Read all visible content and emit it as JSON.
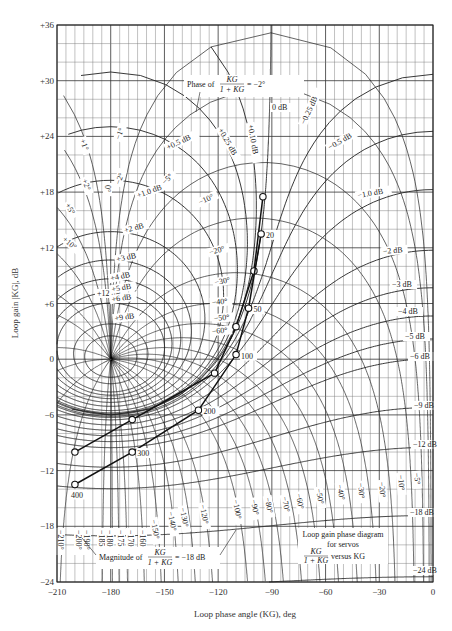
{
  "chart_data": {
    "type": "line",
    "xlabel": "Loop phase angle (KG), deg",
    "ylabel": "Loop gain |KG|, dB",
    "xlim": [
      -210,
      0
    ],
    "ylim": [
      -24,
      36
    ],
    "grid": true,
    "x_ticks": [
      "-210",
      "-180",
      "-150",
      "-120",
      "-90",
      "-60",
      "-30",
      "0"
    ],
    "y_ticks": [
      "+36",
      "+30",
      "+24",
      "+18",
      "+12",
      "+6",
      "0",
      "-6",
      "-12",
      "-18",
      "-24"
    ],
    "magnitude_contours_db": [
      "+12 dB",
      "+9 dB",
      "+6 dB",
      "+5 dB",
      "+4 dB",
      "+3 dB",
      "+2 dB",
      "+1.0 dB",
      "+0.5 dB",
      "+0.25 dB",
      "+0.10 dB",
      "0 dB",
      "-0.25 dB",
      "-0.5 dB",
      "-1.0 dB",
      "-2 dB",
      "-3 dB",
      "-4 dB",
      "-5 dB",
      "-6 dB",
      "-9 dB",
      "-12 dB",
      "-18 dB",
      "-24 dB"
    ],
    "phase_contours_deg": [
      "+1°",
      "+2°",
      "+5°",
      "+10°",
      "0°",
      "-1°",
      "-2°",
      "-5°",
      "-10°",
      "-20°",
      "-30°",
      "-40°",
      "-50°",
      "-60°",
      "-5°",
      "-10°",
      "-20°",
      "-30°",
      "-40°",
      "-50°",
      "-60°",
      "-70°",
      "-80°",
      "-90°",
      "-100°",
      "-120°",
      "-130°",
      "-140°",
      "-150°",
      "-160°",
      "-170°",
      "-175°",
      "-180°",
      "-185°",
      "-190°",
      "-200°",
      "-210°"
    ],
    "series": [
      {
        "name": "Locus A",
        "points": [
          {
            "x": -95,
            "y": 17.5,
            "label": ""
          },
          {
            "x": -100,
            "y": 9.5,
            "label": ""
          },
          {
            "x": -110,
            "y": 3.5,
            "label": ""
          },
          {
            "x": -122,
            "y": -1.5,
            "label": ""
          },
          {
            "x": -168,
            "y": -6.5,
            "label": ""
          },
          {
            "x": -200,
            "y": -10.0,
            "label": ""
          }
        ]
      },
      {
        "name": "Locus B",
        "points": [
          {
            "x": -96,
            "y": 13.5,
            "label": "20"
          },
          {
            "x": -103,
            "y": 5.5,
            "label": "50"
          },
          {
            "x": -110,
            "y": 0.5,
            "label": "100"
          },
          {
            "x": -131,
            "y": -5.5,
            "label": "200"
          },
          {
            "x": -168,
            "y": -10.0,
            "label": "300"
          },
          {
            "x": -200,
            "y": -13.5,
            "label": "400"
          }
        ]
      }
    ],
    "annotations": [
      "Phase of KG/(1+KG) = -2°",
      "Magnitude of KG/(1+KG) = -18 dB",
      "Loop gain phase diagram for servos",
      "KG/(1+KG) versus KG"
    ]
  },
  "labels": {
    "xlabel": "Loop phase angle (KG), deg",
    "ylabel": "Loop gain |KG|, dB",
    "phase_note_prefix": "Phase of",
    "phase_note_suffix": "= −2°",
    "mag_note_prefix": "Magnitude of",
    "mag_note_suffix": "= −18 dB",
    "frac_num": "KG",
    "frac_den": "1 + KG",
    "legend_line1": "Loop gain phase diagram",
    "legend_line2": "for servos",
    "legend_line3": "versus KG"
  }
}
